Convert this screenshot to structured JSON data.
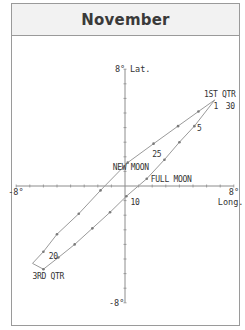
{
  "title": "November",
  "chart_data": {
    "type": "line",
    "title": "November",
    "xlabel": "Long.",
    "ylabel": "Lat.",
    "xlim": [
      -8,
      8
    ],
    "ylim": [
      -8,
      8
    ],
    "axis_end_labels": {
      "x_min": "-8°",
      "x_max": "8°",
      "y_min": "-8°",
      "y_max": "8°"
    },
    "ticks_per_axis_side": 8,
    "grid": false,
    "line_color": "#9a9a9a",
    "series": [
      {
        "name": "upper-path",
        "points": [
          [
            6.6,
            5.9
          ],
          [
            5.4,
            5.1
          ],
          [
            3.9,
            4.1
          ],
          [
            2.1,
            2.9
          ],
          [
            0.2,
            1.6
          ],
          [
            -1.8,
            -0.3
          ],
          [
            -3.4,
            -1.9
          ],
          [
            -5.0,
            -3.3
          ],
          [
            -6.0,
            -4.5
          ],
          [
            -6.8,
            -5.3
          ]
        ]
      },
      {
        "name": "lower-path",
        "points": [
          [
            6.6,
            5.9
          ],
          [
            5.1,
            4.1
          ],
          [
            4.0,
            3.0
          ],
          [
            2.9,
            1.8
          ],
          [
            1.6,
            0.5
          ],
          [
            0.1,
            -0.7
          ],
          [
            -1.1,
            -1.8
          ],
          [
            -2.4,
            -2.9
          ],
          [
            -3.7,
            -4.0
          ],
          [
            -4.9,
            -4.9
          ],
          [
            -6.0,
            -5.7
          ],
          [
            -6.8,
            -5.3
          ]
        ]
      }
    ],
    "annotations": [
      {
        "text": "1ST QTR",
        "x": 5.8,
        "y": 6.1
      },
      {
        "text": "1",
        "x": 6.5,
        "y": 5.3
      },
      {
        "text": "30",
        "x": 7.4,
        "y": 5.3
      },
      {
        "text": "5",
        "x": 5.3,
        "y": 3.8
      },
      {
        "text": "25",
        "x": 2.0,
        "y": 2.0
      },
      {
        "text": "NEW MOON",
        "x": -0.9,
        "y": 1.1
      },
      {
        "text": "FULL MOON",
        "x": 1.9,
        "y": 0.3
      },
      {
        "text": "10",
        "x": 0.4,
        "y": -1.3
      },
      {
        "text": "20",
        "x": -5.6,
        "y": -5.0
      },
      {
        "text": "3RD QTR",
        "x": -6.8,
        "y": -6.4
      }
    ]
  }
}
